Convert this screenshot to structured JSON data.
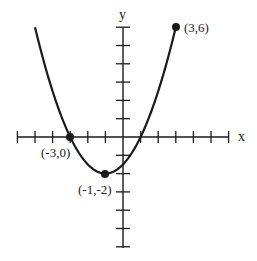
{
  "chart_data": {
    "type": "line",
    "title": "",
    "xlabel": "x",
    "ylabel": "y",
    "xlim": [
      -6,
      6
    ],
    "ylim": [
      -6,
      6
    ],
    "x_tick_step": 1,
    "y_tick_step": 1,
    "grid": false,
    "function": "y = 0.5(x+1)^2 - 2",
    "curve_domain": [
      -5,
      3
    ],
    "series": [
      {
        "name": "parabola",
        "x": [
          -5,
          -4,
          -3,
          -2,
          -1,
          0,
          1,
          2,
          3
        ],
        "y": [
          6,
          2.5,
          0,
          -1.5,
          -2,
          -1.5,
          0,
          2.5,
          6
        ]
      }
    ],
    "annotations": [
      {
        "label": "(3,6)",
        "x": 3,
        "y": 6,
        "marker": "filled-dot"
      },
      {
        "label": "(-3,0)",
        "x": -3,
        "y": 0,
        "marker": "filled-dot"
      },
      {
        "label": "(-1,-2)",
        "x": -1,
        "y": -2,
        "marker": "filled-dot"
      }
    ]
  },
  "axes": {
    "x_label": "x",
    "y_label": "y"
  },
  "points": {
    "p1": "(3,6)",
    "p2": "(-3,0)",
    "p3": "(-1,-2)"
  },
  "colors": {
    "ink": "#1a1a1a",
    "background": "#ffffff"
  }
}
